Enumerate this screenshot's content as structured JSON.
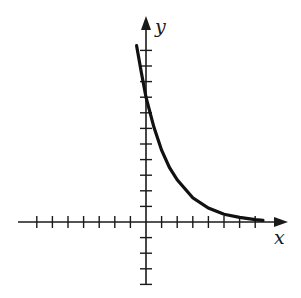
{
  "chart_data": {
    "type": "line",
    "title": "",
    "xlabel": "x",
    "ylabel": "y",
    "grid": false,
    "legend": null,
    "x_ticks": [
      -7,
      -6,
      -5,
      -4,
      -3,
      -2,
      -1,
      1,
      2,
      3,
      4,
      5,
      6,
      7
    ],
    "y_ticks": [
      -4,
      -3,
      -2,
      -1,
      1,
      2,
      3,
      4,
      5,
      6,
      7,
      8,
      9,
      10,
      11
    ],
    "xlim": [
      -8,
      9
    ],
    "ylim": [
      -4,
      13
    ],
    "series": [
      {
        "name": "curve",
        "x": [
          -0.6,
          -0.3,
          0,
          0.5,
          1,
          1.5,
          2,
          3,
          4,
          5,
          6,
          7,
          7.5
        ],
        "y": [
          11.3,
          9.6,
          8.0,
          6.1,
          4.6,
          3.5,
          2.7,
          1.55,
          0.9,
          0.5,
          0.3,
          0.15,
          0.1
        ]
      }
    ],
    "colors": {
      "axes": "#1a1a1a",
      "curve": "#111111"
    }
  },
  "labels": {
    "x": "x",
    "y": "y"
  }
}
